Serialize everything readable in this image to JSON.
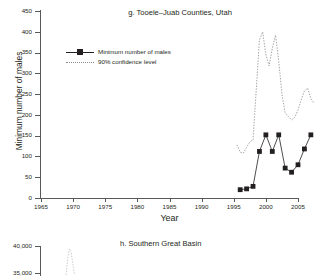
{
  "panel_g": {
    "title": "g. Tooele–Juab Counties, Utah",
    "ylabel": "Minimum number of males",
    "xlabel": "Year",
    "legend": {
      "series_label": "Minimum number of males",
      "ci_label": "90% confidence level"
    },
    "yticks": [
      "0",
      "50",
      "100",
      "150",
      "200",
      "250",
      "300",
      "350",
      "400",
      "450"
    ],
    "xticks": [
      "1965",
      "1970",
      "1975",
      "1980",
      "1985",
      "1990",
      "1995",
      "2000",
      "2005"
    ]
  },
  "panel_h": {
    "title": "h. Southern Great Basin",
    "yticks": [
      "40,000",
      "35,000"
    ]
  },
  "colors": {
    "axis": "#58595b",
    "series": "#231f20",
    "confidence": "#8a8a8d",
    "background": "#ffffff"
  },
  "chart_data": {
    "type": "line",
    "title": "g. Tooele–Juab Counties, Utah",
    "xlabel": "Year",
    "ylabel": "Minimum number of males",
    "xlim": [
      1965,
      2008
    ],
    "ylim": [
      0,
      450
    ],
    "grid": false,
    "legend_position": "upper-left-inside",
    "series": [
      {
        "name": "Minimum number of males",
        "style": "solid-line-with-square-markers",
        "x": [
          1996,
          1997,
          1998,
          1999,
          2000,
          2001,
          2002,
          2003,
          2004,
          2005,
          2006,
          2007
        ],
        "values": [
          20,
          22,
          28,
          112,
          152,
          112,
          152,
          72,
          62,
          80,
          118,
          152
        ]
      },
      {
        "name": "90% confidence level",
        "style": "dotted-line",
        "x": [
          1995.5,
          1996,
          1996.5,
          1997,
          1997.5,
          1998,
          1998.5,
          1999,
          1999.5,
          2000,
          2000.5,
          2001,
          2001.5,
          2002,
          2002.5,
          2003,
          2003.5,
          2004,
          2004.5,
          2005,
          2005.5,
          2006,
          2006.5,
          2007,
          2007.5
        ],
        "values": [
          128,
          110,
          108,
          122,
          135,
          140,
          260,
          380,
          400,
          345,
          318,
          360,
          392,
          330,
          250,
          205,
          196,
          188,
          194,
          212,
          236,
          258,
          264,
          240,
          228
        ]
      }
    ]
  }
}
